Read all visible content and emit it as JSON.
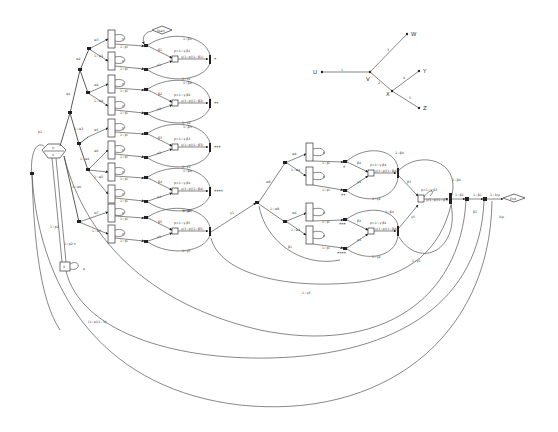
{
  "diagram": {
    "type": "stochastic-petri-net",
    "start_label": "Start",
    "end_label": "End",
    "hex_node": {
      "top": "U",
      "bottom": "V"
    },
    "small_box": {
      "label": "X",
      "loop_label": "p"
    },
    "left_labels": {
      "loop_top": "p1",
      "edge_a": "1−p2",
      "edge_b": "1−p2·V",
      "bottom_curve": "(1−p)(1−V)"
    },
    "branch_labels": [
      "w1",
      "w2",
      "w3",
      "w4",
      "w5",
      "w6",
      "w7",
      "1−w1",
      "1−w2",
      "1−w3",
      "1−w4",
      "1−w5",
      "1−w6",
      "1−w7"
    ],
    "stacks_left": [
      {
        "rows": [
          "x1",
          "x2",
          "x3",
          "x4",
          "x5"
        ],
        "loop": "p"
      },
      {
        "rows": [
          "x1",
          "x2",
          "x3",
          "x4",
          "x5"
        ],
        "loop": "p"
      },
      {
        "rows": [
          "x1",
          "x2",
          "x3",
          "x4",
          "x5"
        ],
        "loop": "p"
      },
      {
        "rows": [
          "x1",
          "x2",
          "x3",
          "x4",
          "x5"
        ],
        "loop": "p"
      },
      {
        "rows": [
          "x1",
          "x2",
          "x3",
          "x4",
          "x5"
        ],
        "loop": "p"
      },
      {
        "rows": [
          "x1",
          "x2",
          "x3",
          "x4",
          "x5"
        ],
        "loop": "p"
      },
      {
        "rows": [
          "x1",
          "x2",
          "x3",
          "x4",
          "x5"
        ],
        "loop": "p"
      },
      {
        "rows": [
          "x1",
          "x2",
          "x3",
          "x4",
          "x5"
        ],
        "loop": "p"
      },
      {
        "rows": [
          "x1",
          "x2",
          "x3",
          "x4",
          "x5"
        ],
        "loop": "p"
      },
      {
        "rows": [
          "x1",
          "x2",
          "x3",
          "x4",
          "x5"
        ],
        "loop": "p"
      }
    ],
    "modules_left": [
      {
        "beta": "β1",
        "gamma": "γ1",
        "top_arc": "1−β1",
        "bottom_arc": "1−γ1",
        "rho": "ρ=1−γ·β1",
        "out": "γ(1−ρ)(1−β1)",
        "mark": "*",
        "edge_in": "1−pi"
      },
      {
        "beta": "β2",
        "gamma": "γ2",
        "top_arc": "1−β2",
        "bottom_arc": "1−γ2",
        "rho": "ρ=1−γ·β2",
        "out": "γ(1−ρ)(1−β2)",
        "mark": "**",
        "edge_in": "1−pi"
      },
      {
        "beta": "β3",
        "gamma": "γ3",
        "top_arc": "1−β3",
        "bottom_arc": "1−γ3",
        "rho": "ρ=1−γ·β3",
        "out": "γ(1−ρ)(1−β3)",
        "mark": "***",
        "edge_in": "1−pi"
      },
      {
        "beta": "β4",
        "gamma": "γ4",
        "top_arc": "1−β4",
        "bottom_arc": "1−γ4",
        "rho": "ρ=1−γ·β4",
        "out": "γ(1−ρ)(1−β4)",
        "mark": "****",
        "edge_in": "1−pi"
      },
      {
        "beta": "β5",
        "gamma": "γ5",
        "top_arc": "1−β5",
        "bottom_arc": "1−γ5",
        "rho": "ρ=1−γ·β5",
        "out": "γ(1−ρ)(1−β5)",
        "mark": "",
        "edge_in": "1−pi"
      }
    ],
    "middle": {
      "edge_to_mid": "γ1",
      "upper_branch": "w8",
      "lower_branch": "1−w8",
      "branch_sub": [
        "w4",
        "1−w4",
        "w4",
        "1−w4"
      ],
      "mid_curve_label": "β1"
    },
    "stacks_right": [
      {
        "rows": [
          "x1",
          "x2",
          "x3",
          "x4",
          "x5"
        ],
        "loop": "p"
      },
      {
        "rows": [
          "x1",
          "x2",
          "x3",
          "x4",
          "x5"
        ],
        "loop": "p"
      },
      {
        "rows": [
          "x1",
          "x2",
          "x3",
          "x4",
          "x5"
        ],
        "loop": "p"
      },
      {
        "rows": [
          "x1",
          "x2",
          "x3",
          "x4",
          "x5"
        ],
        "loop": "p"
      }
    ],
    "modules_right": [
      {
        "beta": "β4",
        "gamma": "γ4",
        "top_arc": "1−β4",
        "bottom_arc": "1−γ4",
        "rho": "ρ=1−γ·β4",
        "out": "γ(1−ρ)(1−β4)",
        "marks": [
          "*",
          "**"
        ],
        "edge_in": "1−pi"
      },
      {
        "beta": "β4",
        "gamma": "γ4",
        "top_arc": "1−β4",
        "bottom_arc": "1−γ4",
        "rho": "ρ=1−γ·β4",
        "out": "γ(1−ρ)(1−β4)",
        "marks": [
          "***",
          "****"
        ],
        "edge_in": "1−pi"
      }
    ],
    "final_module": {
      "beta": "β3",
      "gamma": "γ5",
      "rho": "ρ=1−γ·β3",
      "out": "γ(1−ρ)(1−β3)",
      "top_arc": "1−β4",
      "bottom_arc": "1−γ5"
    },
    "output_chain": [
      "1−β1",
      "1−β1",
      "1−λ/μ"
    ],
    "output_curve_labels": [
      "β1",
      "λ/μ"
    ],
    "bottom_curve_labels": [
      "1−γ5",
      "1−γ5"
    ]
  },
  "tree": {
    "nodes": [
      "U",
      "V",
      "W",
      "X",
      "Y",
      "Z"
    ],
    "edges": [
      {
        "from": "U",
        "to": "V",
        "label": "1"
      },
      {
        "from": "V",
        "to": "W",
        "label": "3"
      },
      {
        "from": "V",
        "to": "X",
        "label": "2"
      },
      {
        "from": "X",
        "to": "Y",
        "label": "4"
      },
      {
        "from": "X",
        "to": "Z",
        "label": "5"
      }
    ]
  }
}
